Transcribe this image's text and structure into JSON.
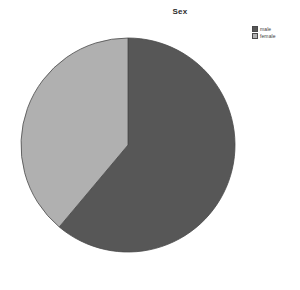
{
  "chart_data": {
    "type": "pie",
    "title": "Sex",
    "categories": [
      "male",
      "female"
    ],
    "values": [
      61,
      39
    ],
    "value_unit": "percent",
    "start_angle_deg": 0,
    "direction": "clockwise",
    "colors": [
      "#575757",
      "#b0b0b0"
    ],
    "legend_position": "top-right",
    "grid": false,
    "xlabel": "",
    "ylabel": "",
    "slices": [
      {
        "label": "male",
        "value": 61,
        "color": "#575757",
        "start_deg": 0,
        "end_deg": 220
      },
      {
        "label": "female",
        "value": 39,
        "color": "#b0b0b0",
        "start_deg": 220,
        "end_deg": 360
      }
    ]
  },
  "legend": {
    "entries": [
      {
        "label": "male",
        "color": "#575757"
      },
      {
        "label": "female",
        "color": "#b0b0b0"
      }
    ]
  },
  "canvas": {
    "background": "#ffffff",
    "outline_color": "#4a4a4a"
  }
}
